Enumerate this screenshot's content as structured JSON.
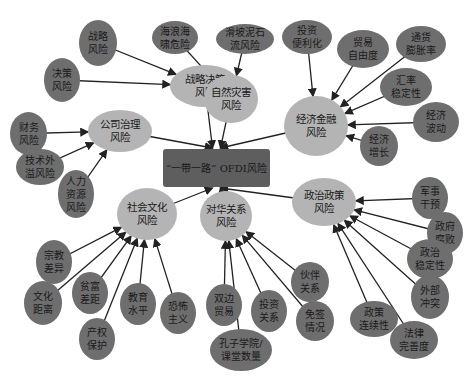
{
  "title": "“一带一路” OFDI风险",
  "colors": {
    "center": "#5e5e5e",
    "category": "#b4b4b4",
    "leaf": "#6e6e6e",
    "edge": "#222222"
  },
  "center": {
    "label": "“一带一路” OFDI风险",
    "x": 163,
    "y": 149,
    "w": 107,
    "h": 38
  },
  "categories": [
    {
      "id": "strategy",
      "label": "战略决策\n风险",
      "x": 170,
      "y": 65,
      "w": 70,
      "h": 42
    },
    {
      "id": "nature",
      "label": "自然灾害\n风险",
      "x": 204,
      "y": 75,
      "w": 54,
      "h": 48
    },
    {
      "id": "econ",
      "label": "经济金融\n风险",
      "x": 284,
      "y": 96,
      "w": 64,
      "h": 60
    },
    {
      "id": "corp",
      "label": "公司治理\n风险",
      "x": 88,
      "y": 110,
      "w": 64,
      "h": 42
    },
    {
      "id": "social",
      "label": "社会文化\n风险",
      "x": 117,
      "y": 188,
      "w": 60,
      "h": 52
    },
    {
      "id": "china",
      "label": "对华关系\n风险",
      "x": 200,
      "y": 191,
      "w": 52,
      "h": 50
    },
    {
      "id": "politic",
      "label": "政治政策\n风险",
      "x": 292,
      "y": 178,
      "w": 64,
      "h": 48
    }
  ],
  "leaves": [
    {
      "parent": "strategy",
      "label": "战略\n风险",
      "x": 79,
      "y": 20,
      "w": 38,
      "h": 46
    },
    {
      "parent": "strategy",
      "label": "决策\n风险",
      "x": 44,
      "y": 58,
      "w": 36,
      "h": 44
    },
    {
      "parent": "nature",
      "label": "海浪海\n啸危险",
      "x": 152,
      "y": 21,
      "w": 46,
      "h": 33
    },
    {
      "parent": "nature",
      "label": "滑坡泥石\n流风险",
      "x": 216,
      "y": 24,
      "w": 58,
      "h": 30
    },
    {
      "parent": "econ",
      "label": "投资\n便利化",
      "x": 282,
      "y": 20,
      "w": 50,
      "h": 34
    },
    {
      "parent": "econ",
      "label": "贸易\n自由度",
      "x": 337,
      "y": 30,
      "w": 52,
      "h": 38
    },
    {
      "parent": "econ",
      "label": "通货\n膨胀率",
      "x": 396,
      "y": 26,
      "w": 50,
      "h": 36
    },
    {
      "parent": "econ",
      "label": "汇率\n稳定性",
      "x": 380,
      "y": 68,
      "w": 52,
      "h": 38
    },
    {
      "parent": "econ",
      "label": "经济\n波动",
      "x": 413,
      "y": 102,
      "w": 46,
      "h": 40
    },
    {
      "parent": "econ",
      "label": "经济\n增长",
      "x": 360,
      "y": 126,
      "w": 38,
      "h": 40
    },
    {
      "parent": "corp",
      "label": "财务\n风险",
      "x": 10,
      "y": 112,
      "w": 37,
      "h": 43
    },
    {
      "parent": "corp",
      "label": "技术外\n溢风险",
      "x": 16,
      "y": 149,
      "w": 48,
      "h": 36
    },
    {
      "parent": "corp",
      "label": "人力\n资源\n风险",
      "x": 58,
      "y": 170,
      "w": 36,
      "h": 48
    },
    {
      "parent": "social",
      "label": "宗教\n差异",
      "x": 36,
      "y": 240,
      "w": 36,
      "h": 44
    },
    {
      "parent": "social",
      "label": "文化\n距离",
      "x": 24,
      "y": 281,
      "w": 38,
      "h": 44
    },
    {
      "parent": "social",
      "label": "贫富\n差距",
      "x": 72,
      "y": 272,
      "w": 36,
      "h": 42
    },
    {
      "parent": "social",
      "label": "产权\n保护",
      "x": 79,
      "y": 318,
      "w": 36,
      "h": 42
    },
    {
      "parent": "social",
      "label": "教育\n水平",
      "x": 120,
      "y": 283,
      "w": 36,
      "h": 42
    },
    {
      "parent": "social",
      "label": "恐怖\n主义",
      "x": 160,
      "y": 292,
      "w": 36,
      "h": 42
    },
    {
      "parent": "china",
      "label": "双边\n贸易",
      "x": 206,
      "y": 284,
      "w": 36,
      "h": 42
    },
    {
      "parent": "china",
      "label": "孔子学院/\n课堂数量",
      "x": 210,
      "y": 329,
      "w": 62,
      "h": 42
    },
    {
      "parent": "china",
      "label": "投资\n关系",
      "x": 251,
      "y": 290,
      "w": 36,
      "h": 42
    },
    {
      "parent": "china",
      "label": "伙伴\n关系",
      "x": 291,
      "y": 262,
      "w": 38,
      "h": 40
    },
    {
      "parent": "china",
      "label": "免签\n情况",
      "x": 296,
      "y": 301,
      "w": 38,
      "h": 40
    },
    {
      "parent": "politic",
      "label": "军事\n干预",
      "x": 412,
      "y": 177,
      "w": 36,
      "h": 42
    },
    {
      "parent": "politic",
      "label": "政府\n腐败",
      "x": 427,
      "y": 212,
      "w": 36,
      "h": 42
    },
    {
      "parent": "politic",
      "label": "政治\n稳定性",
      "x": 407,
      "y": 239,
      "w": 46,
      "h": 40
    },
    {
      "parent": "politic",
      "label": "外部\n冲突",
      "x": 411,
      "y": 275,
      "w": 38,
      "h": 44
    },
    {
      "parent": "politic",
      "label": "政策\n连续性",
      "x": 350,
      "y": 301,
      "w": 48,
      "h": 36
    },
    {
      "parent": "politic",
      "label": "法律\n完善度",
      "x": 390,
      "y": 321,
      "w": 48,
      "h": 38
    }
  ]
}
